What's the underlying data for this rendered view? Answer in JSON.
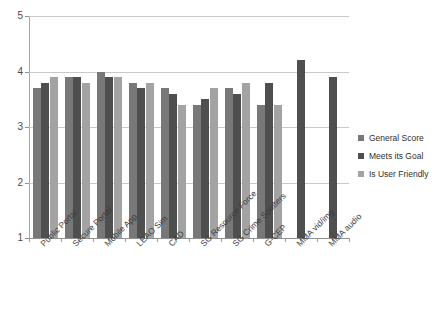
{
  "chart_data": {
    "type": "bar",
    "title": "Scores Across the IT Portfolio",
    "xlabel": "",
    "ylabel": "",
    "ylim": [
      1,
      5
    ],
    "yticks": [
      1,
      2,
      3,
      4,
      5
    ],
    "ytick_labels": [
      "1",
      "2",
      "3",
      "4",
      "5"
    ],
    "grid": true,
    "legend_position": "right",
    "categories": [
      "Public Portal",
      "Secure Portal",
      "Mobile App",
      "LEAO Sim",
      "CAD",
      "SG Resource Force",
      "SG Crime Spotters",
      "G-CEP",
      "MMA vid/img",
      "MMA audio"
    ],
    "series": [
      {
        "name": "General Score",
        "color": "#787878",
        "values": [
          3.7,
          3.9,
          4.0,
          3.8,
          3.7,
          3.4,
          3.7,
          3.4,
          null,
          null
        ]
      },
      {
        "name": "Meets its Goal",
        "color": "#4f4f4f",
        "values": [
          3.8,
          3.9,
          3.9,
          3.7,
          3.6,
          3.5,
          3.6,
          3.8,
          4.2,
          3.9
        ]
      },
      {
        "name": "Is User Friendly",
        "color": "#a3a3a3",
        "values": [
          3.9,
          3.8,
          3.9,
          3.8,
          3.4,
          3.7,
          3.8,
          3.4,
          null,
          null
        ]
      }
    ]
  },
  "legend": {
    "items": [
      {
        "label": "General Score"
      },
      {
        "label": "Meets its Goal"
      },
      {
        "label": "Is User Friendly"
      }
    ]
  }
}
